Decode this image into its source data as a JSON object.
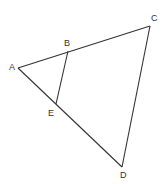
{
  "diagram": {
    "points": {
      "A": {
        "label": "A",
        "x": 18,
        "y": 68,
        "lx": 9,
        "ly": 70
      },
      "B": {
        "label": "B",
        "x": 68,
        "y": 51,
        "lx": 64,
        "ly": 46
      },
      "C": {
        "label": "C",
        "x": 150,
        "y": 26,
        "lx": 151,
        "ly": 21
      },
      "D": {
        "label": "D",
        "x": 122,
        "y": 167,
        "lx": 120,
        "ly": 178
      },
      "E": {
        "label": "E",
        "x": 56,
        "y": 104,
        "lx": 48,
        "ly": 116
      }
    },
    "segments": [
      [
        "A",
        "C"
      ],
      [
        "C",
        "D"
      ],
      [
        "D",
        "A"
      ],
      [
        "B",
        "E"
      ]
    ]
  }
}
